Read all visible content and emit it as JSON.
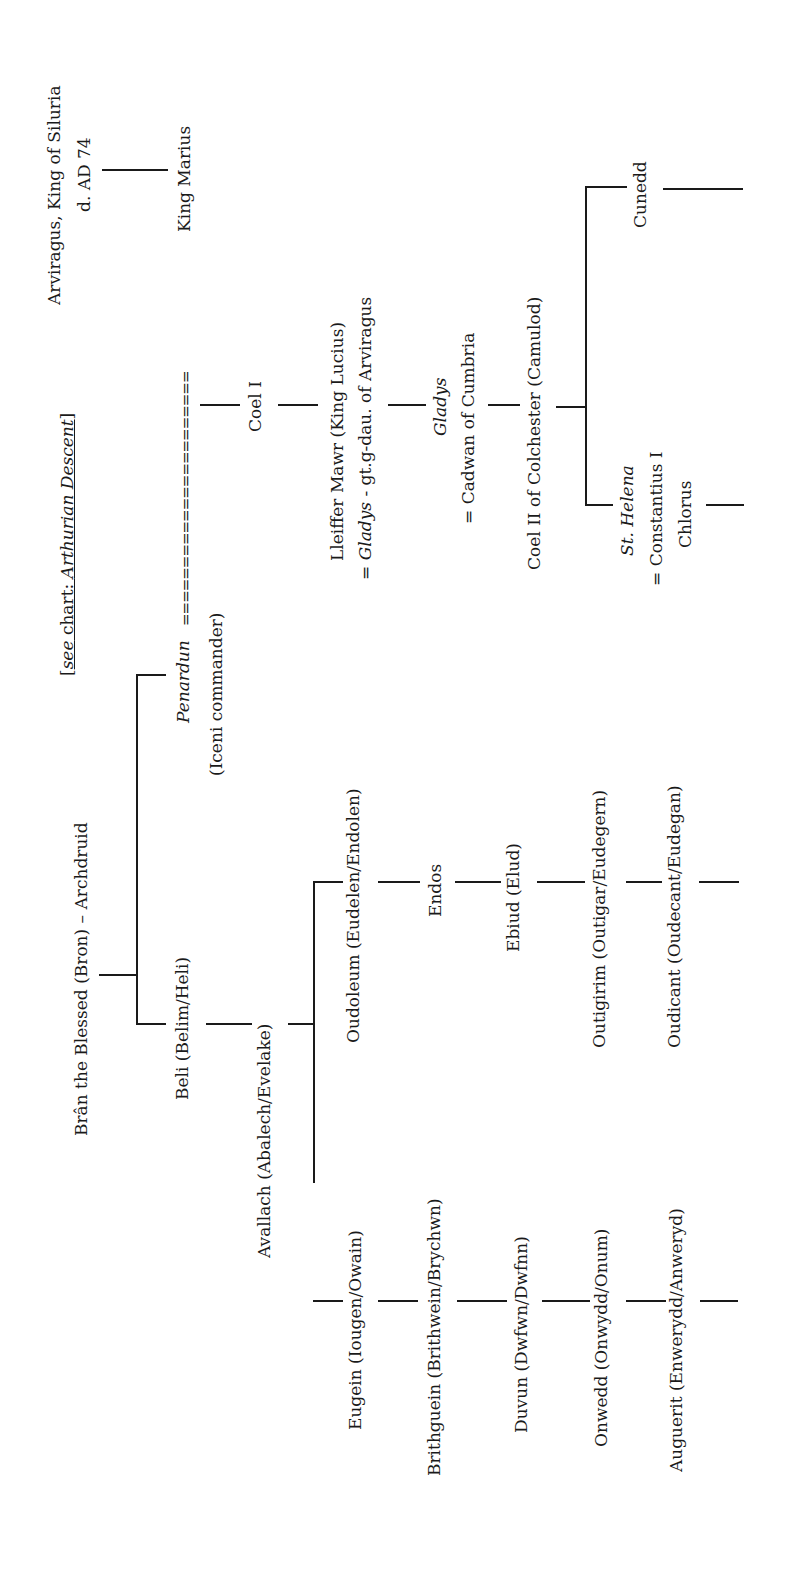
{
  "orientation": "rotated -90deg (reads bottom-to-top)",
  "reference_note": {
    "prefix": "[",
    "see": "see",
    "chart_label": " chart: ",
    "chart_name": "Arthurian Descent",
    "suffix": "]"
  },
  "people": {
    "arviragus": {
      "line1": "Arviragus, King of Siluria",
      "line2": "d. AD 74"
    },
    "king_marius": {
      "name": "King Marius"
    },
    "marriage_symbol": "======================",
    "bran": {
      "name": "Brân the Blessed (Bron) – Archdruid"
    },
    "penardun": {
      "name": "Penardun",
      "note": "(Iceni commander)"
    },
    "beli": {
      "name": "Beli (Belim/Heli)"
    },
    "coel1": {
      "name": "Coel I"
    },
    "lleiffer": {
      "line1": "Lleiffer Mawr (King Lucius)",
      "line2_prefix": "= ",
      "line2_italic": "Gladys",
      "line2_rest": " - gt.g-dau. of Arviragus"
    },
    "gladys": {
      "name": "Gladys",
      "spouse": "= Cadwan of Cumbria"
    },
    "coel2": {
      "name": "Coel II of Colchester (Camulod)"
    },
    "cunedd": {
      "name": "Cunedd"
    },
    "helena": {
      "name": "St. Helena",
      "spouse": "= Constantius I",
      "spouse_line2": "Chlorus"
    },
    "avallach": {
      "name": "Avallach (Abalech/Evelake)"
    },
    "oudoleum": {
      "name": "Oudoleum (Eudelen/Endolen)"
    },
    "endos": {
      "name": "Endos"
    },
    "ebiud": {
      "name": "Ebiud (Elud)"
    },
    "outigirim": {
      "name": "Outigirim (Outigar/Eudegern)"
    },
    "oudicant": {
      "name": "Oudicant (Oudecant/Eudegan)"
    },
    "eugein": {
      "name": "Eugein (Iougen/Owain)"
    },
    "brithguein": {
      "name": "Brithguein (Brithwein/Brychwn)"
    },
    "duvun": {
      "name": "Duvun (Dwfwn/Dwfnn)"
    },
    "onwedd": {
      "name": "Onwedd (Onwydd/Onum)"
    },
    "auguerit": {
      "name": "Auguerit (Enwerydd/Anweryd)"
    }
  }
}
